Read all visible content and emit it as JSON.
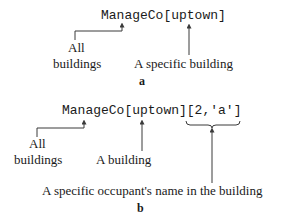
{
  "panel_a": {
    "code": "ManageCo[uptown]",
    "annotations": {
      "all_buildings_line1": "All",
      "all_buildings_line2": "buildings",
      "specific_building": "A specific building"
    },
    "label": "a"
  },
  "panel_b": {
    "code": "ManageCo[uptown][2,'a']",
    "annotations": {
      "all_buildings_line1": "All",
      "all_buildings_line2": "buildings",
      "a_building": "A building",
      "occupant_name": "A specific occupant's name in the building"
    },
    "label": "b"
  },
  "colors": {
    "text": "#1a1a1a",
    "lines": "#3a3a3a",
    "background": "#ffffff"
  }
}
